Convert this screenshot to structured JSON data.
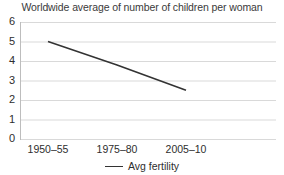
{
  "chart_data": {
    "type": "line",
    "title": "Worldwide average of number of children per woman",
    "xlabel": "",
    "ylabel": "",
    "categories": [
      "1950–55",
      "1975–80",
      "2005–10"
    ],
    "series": [
      {
        "name": "Avg fertility",
        "values": [
          5.0,
          3.8,
          2.5
        ],
        "color": "#333333"
      }
    ],
    "ylim": [
      0,
      6
    ],
    "yticks": [
      0,
      1,
      2,
      3,
      4,
      5,
      6
    ],
    "ytick_labels": [
      "0",
      "1",
      "2",
      "3",
      "4",
      "5",
      "6"
    ],
    "grid": true,
    "grid_color": "#d9d9d9",
    "legend_position": "bottom",
    "background": "#ffffff"
  },
  "legend": {
    "entry_label": "Avg fertility",
    "swatch_icon": "line-swatch-icon"
  }
}
